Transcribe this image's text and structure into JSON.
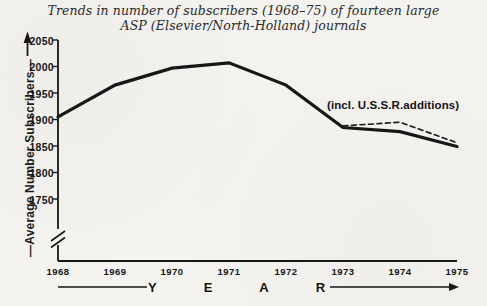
{
  "page": {
    "background_color": "#f4f3f0",
    "ink_color": "#171717"
  },
  "title": {
    "line1": "Trends in number of subscribers (1968–75) of fourteen large",
    "line2": "ASP (Elsevier/North-Holland) journals"
  },
  "y_axis": {
    "label": "—Average Number Subscribers—",
    "tick_labels": [
      "2050",
      "2000",
      "1950",
      "1900",
      "1850",
      "1800",
      "1750"
    ],
    "has_break_mark": true
  },
  "x_axis": {
    "label": "YEAR",
    "tick_labels": [
      "1968",
      "1969",
      "1970",
      "1971",
      "1972",
      "1973",
      "1974",
      "1975"
    ]
  },
  "annotation": {
    "text": "(incl. U.S.S.R.additions)"
  },
  "chart_data": {
    "type": "line",
    "title": "Trends in number of subscribers (1968–75) of fourteen large ASP (Elsevier/North-Holland) journals",
    "x": [
      1968,
      1969,
      1970,
      1971,
      1972,
      1973,
      1974,
      1975
    ],
    "series": [
      {
        "name": "Average Number Subscribers",
        "line_style": "solid",
        "x": [
          1968,
          1969,
          1970,
          1971,
          1972,
          1973,
          1974,
          1975
        ],
        "values": [
          1905,
          1965,
          1997,
          2007,
          1965,
          1885,
          1877,
          1849
        ]
      },
      {
        "name": "(incl. U.S.S.R.additions)",
        "line_style": "dashed",
        "x": [
          1973,
          1974,
          1975
        ],
        "values": [
          1888,
          1895,
          1856
        ]
      }
    ],
    "xlabel": "YEAR",
    "ylabel": "Average Number Subscribers",
    "ylim": [
      1750,
      2050
    ],
    "y_ticks": [
      2050,
      2000,
      1950,
      1900,
      1850,
      1800,
      1750
    ],
    "y_axis_break_below_min": true,
    "grid": false,
    "legend_position": "none"
  }
}
